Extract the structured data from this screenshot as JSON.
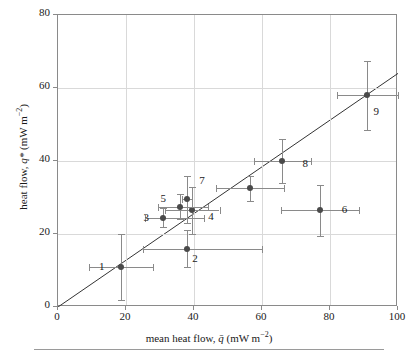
{
  "chart_data": {
    "type": "scatter",
    "title": "",
    "xlabel": "mean heat flow, q̄ (mW m⁻²)",
    "ylabel": "heat flow, q* (mW m⁻²)",
    "xlim": [
      0,
      100
    ],
    "ylim": [
      0,
      80
    ],
    "xticks": [
      0,
      20,
      40,
      60,
      80,
      100
    ],
    "yticks": [
      0,
      20,
      40,
      60,
      80
    ],
    "xticklabels": [
      "0",
      "20",
      "40",
      "60",
      "80",
      "100"
    ],
    "yticklabels": [
      "0",
      "20",
      "40",
      "60",
      "80"
    ],
    "grid": true,
    "legend": "none",
    "marker_color": "#4a4a4a",
    "errorbar_color": "#8a8a8a",
    "grid_color": "#d9d9d9",
    "axis_color": "#8a8a8a",
    "fit_line": {
      "type": "linear",
      "x0": 0,
      "y0": 0,
      "x1": 100,
      "y1": 64
    },
    "points": [
      {
        "label": "1",
        "x": 18.5,
        "y": 11.0,
        "xerr_lo": 9.5,
        "xerr_hi": 9.5,
        "yerr_lo": 9.0,
        "yerr_hi": 9.0,
        "label_dx": -22,
        "label_dy": 0
      },
      {
        "label": "2",
        "x": 38.0,
        "y": 16.0,
        "xerr_lo": 13.0,
        "xerr_hi": 22.0,
        "yerr_lo": 5.0,
        "yerr_hi": 5.0,
        "label_dx": 5,
        "label_dy": 10
      },
      {
        "label": "3",
        "x": 31.0,
        "y": 24.5,
        "xerr_lo": 5.5,
        "xerr_hi": 12.0,
        "yerr_lo": 2.5,
        "yerr_hi": 2.5,
        "label_dx": -20,
        "label_dy": 0
      },
      {
        "label": "4",
        "x": 39.5,
        "y": 26.5,
        "xerr_lo": 8.0,
        "xerr_hi": 8.0,
        "yerr_lo": 6.5,
        "yerr_hi": 6.5,
        "label_dx": 16,
        "label_dy": 7
      },
      {
        "label": "5",
        "x": 36.0,
        "y": 27.5,
        "xerr_lo": 6.5,
        "xerr_hi": 8.0,
        "yerr_lo": 3.5,
        "yerr_hi": 3.5,
        "label_dx": -20,
        "label_dy": -8
      },
      {
        "label": "6",
        "x": 77.0,
        "y": 26.5,
        "xerr_lo": 11.5,
        "xerr_hi": 11.5,
        "yerr_lo": 7.0,
        "yerr_hi": 7.0,
        "label_dx": 22,
        "label_dy": 0
      },
      {
        "label": "7",
        "x": 38.0,
        "y": 29.5,
        "xerr_lo": 1.5,
        "xerr_hi": 1.5,
        "yerr_lo": 6.5,
        "yerr_hi": 6.5,
        "label_dx": 12,
        "label_dy": -18
      },
      {
        "label": "8",
        "x": 56.5,
        "y": 32.5,
        "xerr_lo": 10.0,
        "xerr_hi": 10.0,
        "yerr_lo": 3.5,
        "yerr_hi": 3.5,
        "label_dx": 0,
        "label_dy": 0,
        "hide_label": true
      },
      {
        "label": "8",
        "x": 66.0,
        "y": 40.0,
        "xerr_lo": 8.5,
        "xerr_hi": 8.5,
        "yerr_lo": 6.0,
        "yerr_hi": 6.0,
        "label_dx": 20,
        "label_dy": 3
      },
      {
        "label": "9",
        "x": 91.0,
        "y": 58.0,
        "xerr_lo": 9.0,
        "xerr_hi": 9.0,
        "yerr_lo": 9.5,
        "yerr_hi": 9.5,
        "label_dx": 6,
        "label_dy": 17
      }
    ]
  },
  "axis": {
    "x_title_text": "mean heat flow, ",
    "x_title_sym": "q̄",
    "x_title_unit": " (mW m",
    "x_title_exp": "−2",
    "x_title_close": ")",
    "y_title_text": "heat flow, ",
    "y_title_sym": "q*",
    "y_title_unit": " (mW m",
    "y_title_exp": "−2",
    "y_title_close": ")"
  }
}
